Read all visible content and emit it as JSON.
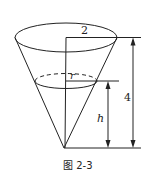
{
  "figure": {
    "caption": "图 2-3",
    "labels": {
      "top_radius": "2",
      "water_radius": "r",
      "water_height": "h",
      "total_height": "4"
    },
    "colors": {
      "stroke": "#222222",
      "background": "#ffffff"
    }
  }
}
